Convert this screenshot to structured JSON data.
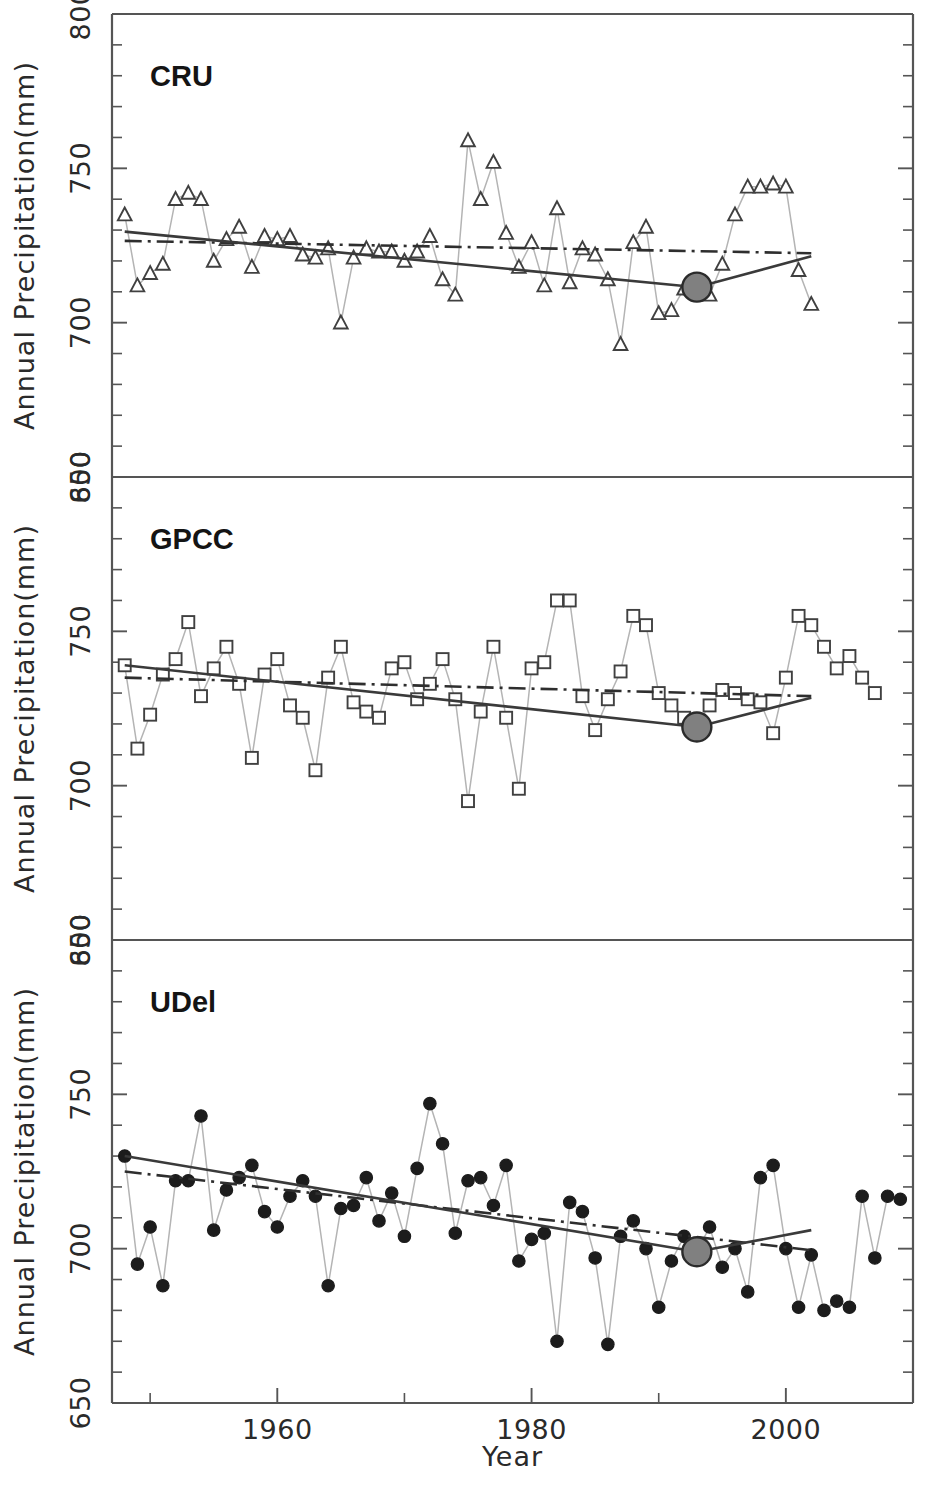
{
  "figure": {
    "xlabel": "Year",
    "ylabel": "Annual Precipitation(mm)"
  },
  "axes": {
    "y_ticklabels": [
      "650",
      "700",
      "750",
      "800"
    ],
    "y_tickvalues": [
      650,
      700,
      750,
      800
    ],
    "y_minor_step": 10,
    "x_ticklabels": [
      "1960",
      "1980",
      "2000"
    ],
    "x_tickvalues": [
      1960,
      1980,
      2000
    ],
    "x_minor_tickvalues": [
      1950,
      1970,
      1990,
      2010
    ],
    "ylim": [
      650,
      800
    ],
    "xlim": [
      1947,
      2010
    ]
  },
  "chart_data": {
    "type": "line",
    "title": "",
    "xlabel": "Year",
    "ylabel": "Annual Precipitation(mm)",
    "ylim": [
      650,
      800
    ],
    "xlim": [
      1947,
      2010
    ],
    "grid": false,
    "legend": "none",
    "panel_layout": "3 stacked panels sharing the x axis",
    "marker_styles": {
      "CRU": "open-triangle",
      "GPCC": "open-square",
      "UDel": "filled-circle"
    },
    "line_styles": {
      "annual_series": "thin solid light-gray with markers",
      "piecewise_trend": "solid dark, bends at changepoint",
      "linear_trend": "dash-dot dark"
    },
    "changepoint_marker": {
      "shape": "filled-circle",
      "color": "#808080",
      "edge": "#2b2b2b"
    },
    "panels": [
      {
        "name": "CRU",
        "label": "CRU",
        "x": [
          1948,
          1949,
          1950,
          1951,
          1952,
          1953,
          1954,
          1955,
          1956,
          1957,
          1958,
          1959,
          1960,
          1961,
          1962,
          1963,
          1964,
          1965,
          1966,
          1967,
          1968,
          1969,
          1970,
          1971,
          1972,
          1973,
          1974,
          1975,
          1976,
          1977,
          1978,
          1979,
          1980,
          1981,
          1982,
          1983,
          1984,
          1985,
          1986,
          1987,
          1988,
          1989,
          1990,
          1991,
          1992,
          1993,
          1994,
          1995,
          1996,
          1997,
          1998,
          1999,
          2000,
          2001,
          2002
        ],
        "values": [
          735,
          712,
          716,
          719,
          740,
          742,
          740,
          720,
          727,
          731,
          718,
          728,
          727,
          728,
          722,
          721,
          724,
          700,
          721,
          724,
          723,
          723,
          720,
          723,
          728,
          714,
          709,
          759,
          740,
          752,
          729,
          718,
          726,
          712,
          737,
          713,
          724,
          722,
          714,
          693,
          726,
          731,
          703,
          704,
          711,
          712,
          709,
          719,
          735,
          744,
          744,
          745,
          744,
          717,
          706
        ],
        "piecewise_trend": {
          "breakpoints_x": [
            1948,
            1993,
            2002
          ],
          "breakpoints_y": [
            729.5,
            711.5,
            721.5
          ]
        },
        "linear_trend": {
          "x": [
            1948,
            2002
          ],
          "y": [
            726.5,
            722.5
          ]
        },
        "changepoint": {
          "x": 1993,
          "y": 711.5
        }
      },
      {
        "name": "GPCC",
        "label": "GPCC",
        "x": [
          1948,
          1949,
          1950,
          1951,
          1952,
          1953,
          1954,
          1955,
          1956,
          1957,
          1958,
          1959,
          1960,
          1961,
          1962,
          1963,
          1964,
          1965,
          1966,
          1967,
          1968,
          1969,
          1970,
          1971,
          1972,
          1973,
          1974,
          1975,
          1976,
          1977,
          1978,
          1979,
          1980,
          1981,
          1982,
          1983,
          1984,
          1985,
          1986,
          1987,
          1988,
          1989,
          1990,
          1991,
          1992,
          1993,
          1994,
          1995,
          1996,
          1997,
          1998,
          1999,
          2000,
          2001,
          2002,
          2003,
          2004,
          2005,
          2006,
          2007
        ],
        "values": [
          739,
          712,
          723,
          736,
          741,
          753,
          729,
          738,
          745,
          733,
          709,
          736,
          741,
          726,
          722,
          705,
          735,
          745,
          727,
          724,
          722,
          738,
          740,
          728,
          733,
          741,
          728,
          695,
          724,
          745,
          722,
          699,
          738,
          740,
          760,
          760,
          729,
          718,
          728,
          737,
          755,
          752,
          730,
          726,
          722,
          720,
          726,
          731,
          730,
          728,
          727,
          717,
          735,
          755,
          752,
          745,
          738,
          742,
          735,
          730
        ],
        "piecewise_trend": {
          "breakpoints_x": [
            1948,
            1993,
            2002
          ],
          "breakpoints_y": [
            739.0,
            719.0,
            728.5
          ]
        },
        "linear_trend": {
          "x": [
            1948,
            2002
          ],
          "y": [
            735.0,
            729.0
          ]
        },
        "changepoint": {
          "x": 1993,
          "y": 719.0
        }
      },
      {
        "name": "UDel",
        "label": "UDel",
        "x": [
          1948,
          1949,
          1950,
          1951,
          1952,
          1953,
          1954,
          1955,
          1956,
          1957,
          1958,
          1959,
          1960,
          1961,
          1962,
          1963,
          1964,
          1965,
          1966,
          1967,
          1968,
          1969,
          1970,
          1971,
          1972,
          1973,
          1974,
          1975,
          1976,
          1977,
          1978,
          1979,
          1980,
          1981,
          1982,
          1983,
          1984,
          1985,
          1986,
          1987,
          1988,
          1989,
          1990,
          1991,
          1992,
          1993,
          1994,
          1995,
          1996,
          1997,
          1998,
          1999,
          2000,
          2001,
          2002,
          2003,
          2004,
          2005,
          2006,
          2007,
          2008,
          2009
        ],
        "values": [
          730,
          695,
          707,
          688,
          722,
          722,
          743,
          706,
          719,
          723,
          727,
          712,
          707,
          717,
          722,
          717,
          688,
          713,
          714,
          723,
          709,
          718,
          704,
          726,
          747,
          734,
          705,
          722,
          723,
          714,
          727,
          696,
          703,
          705,
          670,
          715,
          712,
          697,
          669,
          704,
          709,
          700,
          681,
          696,
          704,
          699,
          707,
          694,
          700,
          686,
          723,
          727,
          700,
          681,
          698,
          680,
          683,
          681,
          717,
          697,
          717,
          716
        ],
        "piecewise_trend": {
          "breakpoints_x": [
            1948,
            1993,
            2002
          ],
          "breakpoints_y": [
            730.0,
            699.0,
            706.0
          ]
        },
        "linear_trend": {
          "x": [
            1948,
            2002
          ],
          "y": [
            725.0,
            699.5
          ]
        },
        "changepoint": {
          "x": 1993,
          "y": 699.0
        }
      }
    ]
  }
}
